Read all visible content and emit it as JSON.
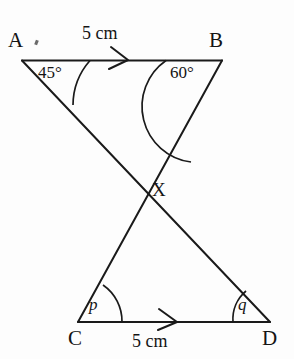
{
  "figure": {
    "background_color": "#fdfdfd",
    "stroke_color": "#1a1a1a",
    "vertices": [
      {
        "name": "A",
        "label": "A",
        "x": 22,
        "y": 60
      },
      {
        "name": "B",
        "label": "B",
        "x": 222,
        "y": 60
      },
      {
        "name": "C",
        "label": "C",
        "x": 78,
        "y": 322
      },
      {
        "name": "D",
        "label": "D",
        "x": 270,
        "y": 322
      },
      {
        "name": "X",
        "label": "X",
        "x": 145,
        "y": 190
      }
    ],
    "segments": [
      {
        "name": "segment-AB",
        "from": "A",
        "to": "B"
      },
      {
        "name": "segment-AD",
        "from": "A",
        "to": "D"
      },
      {
        "name": "segment-BC",
        "from": "B",
        "to": "C"
      },
      {
        "name": "segment-CD",
        "from": "C",
        "to": "D"
      }
    ],
    "angles": [
      {
        "name": "angle-at-A",
        "at": "A",
        "label": "45°",
        "value": 45,
        "unit": "degrees"
      },
      {
        "name": "angle-at-B",
        "at": "B",
        "label": "60°",
        "value": 60,
        "unit": "degrees"
      },
      {
        "name": "angle-at-C",
        "at": "C",
        "label": "p",
        "value": null,
        "unit": "unknown"
      },
      {
        "name": "angle-at-D",
        "at": "D",
        "label": "q",
        "value": null,
        "unit": "unknown"
      }
    ],
    "lengths": [
      {
        "name": "length-AB",
        "segment": "AB",
        "label": "5 cm",
        "value": 5,
        "unit": "cm",
        "position": "above"
      },
      {
        "name": "length-CD",
        "segment": "CD",
        "label": "5 cm",
        "value": 5,
        "unit": "cm",
        "position": "below"
      }
    ],
    "markers": [
      {
        "name": "arrow-marker-AB",
        "on": "segment-AB",
        "type": "single-arrow",
        "direction": "right"
      },
      {
        "name": "arrow-marker-CD",
        "on": "segment-CD",
        "type": "single-arrow",
        "direction": "right"
      }
    ],
    "intersection": {
      "name": "intersection-point-X",
      "label": "X",
      "x": 145,
      "y": 190
    }
  }
}
